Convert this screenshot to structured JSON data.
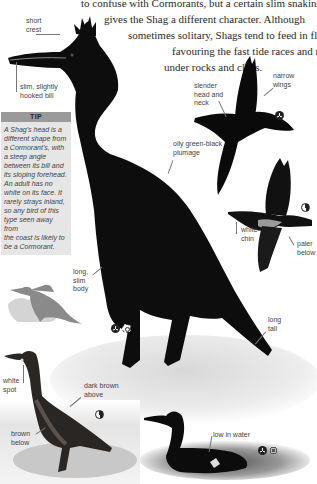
{
  "intro": {
    "lines": [
      "to confuse with Cormorants, but a certain slim snakiness",
      "gives the Shag a different character. Although",
      "sometimes solitary, Shags tend to feed in flocks,",
      "favouring the fast tide races and rough water",
      "under rocks and cliffs."
    ]
  },
  "labels": {
    "short_crest": "short\ncrest",
    "bill": "slim, slightly\nhooked bill",
    "plumage": "oily green-black\nplumage",
    "slender_head": "slender\nhead and\nneck",
    "narrow_wings": "narrow\nwings",
    "white_chin": "white\nchin",
    "paler_below": "paler\nbelow",
    "long_body": "long,\nslim\nbody",
    "long_tail": "long\ntail",
    "white_spot": "white\nspot",
    "dark_brown_above": "dark brown\nabove",
    "brown_below": "brown\nbelow",
    "low_in_water": "low in water"
  },
  "tip": {
    "title": "TIP",
    "body": "A Shag's head is a\ndifferent shape from\na Cormorant's, with\na steep angle\nbetween its bill and\nits sloping forehead.\nAn adult has no\nwhite on its face. It\nrarely strays inland,\nso any bird of this\ntype seen away from\nthe coast is likely to\nbe a Cormorant."
  },
  "icons": {
    "main": [
      "flight-icon",
      "summer-icon"
    ],
    "flight_top": [
      "flight-icon"
    ],
    "flight_lower": [
      "half-year-icon"
    ],
    "juvenile": [
      "half-year-icon"
    ],
    "swimming": [
      "flight-icon",
      "winter-icon"
    ]
  },
  "colors": {
    "tip_header": "#9a9a9a",
    "tip_body": "#e6e6e6",
    "silhouette": "#8a8a8a",
    "silhouette_pale": "#d4d4d4",
    "bird": "#111111"
  }
}
